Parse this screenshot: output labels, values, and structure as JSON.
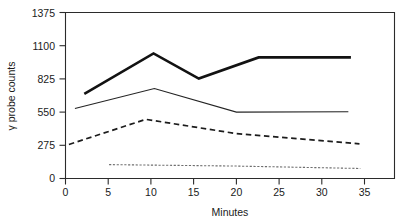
{
  "chart_data": {
    "type": "line",
    "title": "",
    "xlabel": "Minutes",
    "ylabel": "γ probe counts",
    "xlim": [
      0,
      38.5
    ],
    "ylim": [
      0,
      1375
    ],
    "grid": false,
    "legend": "none",
    "xticks": [
      "0",
      "5",
      "10",
      "15",
      "20",
      "25",
      "30",
      "35"
    ],
    "xtick_values": [
      0,
      5,
      10,
      15,
      20,
      25,
      30,
      35
    ],
    "yticks": [
      "0",
      "275",
      "550",
      "825",
      "1100",
      "1375"
    ],
    "ytick_values": [
      0,
      275,
      550,
      825,
      1100,
      1375
    ],
    "series": [
      {
        "name": "series-1-thick-solid",
        "style": "thick solid",
        "x": [
          2.2,
          10.3,
          15.6,
          22.6,
          33.4
        ],
        "values": [
          700,
          1036,
          828,
          1003,
          1003
        ]
      },
      {
        "name": "series-2-thin-solid",
        "style": "thin solid",
        "x": [
          1.1,
          10.4,
          20.0,
          33.1
        ],
        "values": [
          580,
          745,
          550,
          553
        ]
      },
      {
        "name": "series-3-dashed",
        "style": "dashed",
        "x": [
          0.4,
          9.4,
          20.0,
          34.4
        ],
        "values": [
          282,
          490,
          372,
          287
        ]
      },
      {
        "name": "series-4-dotted",
        "style": "dotted",
        "x": [
          5.1,
          20.0,
          34.5
        ],
        "values": [
          115,
          103,
          83
        ]
      }
    ]
  },
  "axis": {
    "y_label": "γ probe counts",
    "x_label": "Minutes",
    "y_tick_0": "0",
    "y_tick_1": "275",
    "y_tick_2": "550",
    "y_tick_3": "825",
    "y_tick_4": "1100",
    "y_tick_5": "1375",
    "x_tick_0": "0",
    "x_tick_1": "5",
    "x_tick_2": "10",
    "x_tick_3": "15",
    "x_tick_4": "20",
    "x_tick_5": "25",
    "x_tick_6": "30",
    "x_tick_7": "35"
  },
  "colors": {
    "background": "#ffffff",
    "axis": "#2b2b2b",
    "series_thick": "#121212",
    "series_thin": "#242424",
    "series_dashed": "#1c1c1c",
    "series_dotted": "#6e6e6e"
  }
}
